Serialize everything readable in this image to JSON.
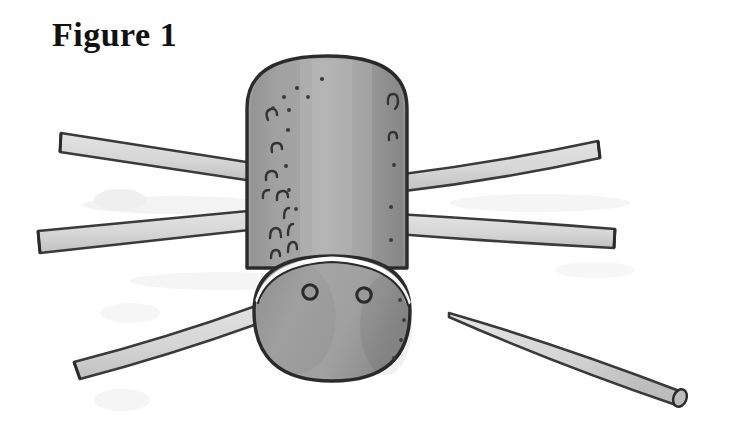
{
  "page": {
    "background_color": "#ffffff",
    "width": 731,
    "height": 434
  },
  "caption": {
    "text": "Figure 1",
    "color": "#111111"
  },
  "illustration": {
    "name": "spider-craft-diagram",
    "subject": "spider made from a cardboard tube body and drinking straw legs",
    "style": "hand-drawn grayscale line illustration with flat grey shading",
    "palette": {
      "body_fill": "#a6a6a6",
      "body_shadow": "#949494",
      "body_highlight": "#b4b4b4",
      "head_fill": "#9e9e9e",
      "outline": "#2b2b2b",
      "leg_fill": "#d9d9d9",
      "leg_fill_shadow": "#c2c2c2",
      "leg_outline": "#3a3a3a",
      "eye_color": "#2a2a2a",
      "highlight_white": "#ffffff",
      "smudge": "#e6e6e6"
    },
    "parts": {
      "body": {
        "name": "tube-body",
        "shape": "vertical rounded cylinder",
        "x": 243,
        "y": 52,
        "width": 168,
        "height": 218
      },
      "head": {
        "name": "head",
        "shape": "rounded oval",
        "cx": 332,
        "cy": 318,
        "rx": 78,
        "ry": 63
      },
      "eyes": [
        {
          "name": "eye-left",
          "cx": 310,
          "cy": 292,
          "r": 7
        },
        {
          "name": "eye-right",
          "cx": 364,
          "cy": 295,
          "r": 7
        }
      ],
      "neck_highlight": {
        "name": "neck-highlight-arc",
        "description": "white crescent where the head meets the tube body"
      },
      "legs": [
        {
          "name": "leg-upper-left",
          "side": "left",
          "attached": true,
          "direction": "up-left"
        },
        {
          "name": "leg-lower-left",
          "side": "left",
          "attached": true,
          "direction": "left"
        },
        {
          "name": "leg-bottom-left",
          "side": "left",
          "attached": true,
          "direction": "down-left"
        },
        {
          "name": "leg-upper-right",
          "side": "right",
          "attached": true,
          "direction": "up-right"
        },
        {
          "name": "leg-lower-right",
          "side": "right",
          "attached": true,
          "direction": "right"
        },
        {
          "name": "leg-detached-right",
          "side": "right",
          "attached": false,
          "direction": "down-right",
          "note": "separate straw showing hollow open end"
        }
      ],
      "bristle_marks": {
        "name": "bristle-marks",
        "description": "small hook and dot marks along the left edge of the tube body",
        "count": 14
      },
      "smudges": {
        "name": "background-smudges",
        "description": "faint pale grey printing smudges behind the left legs",
        "count": 4
      }
    }
  }
}
